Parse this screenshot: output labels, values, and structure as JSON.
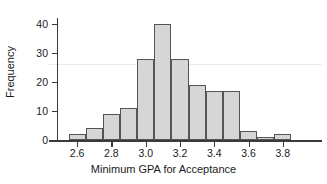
{
  "chart_data": {
    "type": "bar",
    "title": "",
    "subtitle": "",
    "xlabel": "Minimum GPA for Acceptance",
    "ylabel": "Frequency",
    "xlim": [
      2.5,
      3.9
    ],
    "ylim": [
      0,
      42
    ],
    "grid": true,
    "legend": null,
    "bin_width": 0.1,
    "xticks": [
      "2.6",
      "2.8",
      "3.0",
      "3.2",
      "3.4",
      "3.6",
      "3.8"
    ],
    "xtick_values": [
      2.6,
      2.8,
      3.0,
      3.2,
      3.4,
      3.6,
      3.8
    ],
    "yticks": [
      "0",
      "10",
      "20",
      "30",
      "40"
    ],
    "ytick_values": [
      0,
      10,
      20,
      30,
      40
    ],
    "gridlines_y": [
      26
    ],
    "bins": [
      {
        "left": 2.55,
        "right": 2.65,
        "center": 2.6,
        "value": 2
      },
      {
        "left": 2.65,
        "right": 2.75,
        "center": 2.7,
        "value": 4
      },
      {
        "left": 2.75,
        "right": 2.85,
        "center": 2.8,
        "value": 9
      },
      {
        "left": 2.85,
        "right": 2.95,
        "center": 2.9,
        "value": 11
      },
      {
        "left": 2.95,
        "right": 3.05,
        "center": 3.0,
        "value": 28
      },
      {
        "left": 3.05,
        "right": 3.15,
        "center": 3.1,
        "value": 40
      },
      {
        "left": 3.15,
        "right": 3.25,
        "center": 3.2,
        "value": 28
      },
      {
        "left": 3.25,
        "right": 3.35,
        "center": 3.3,
        "value": 19
      },
      {
        "left": 3.35,
        "right": 3.45,
        "center": 3.4,
        "value": 17
      },
      {
        "left": 3.45,
        "right": 3.55,
        "center": 3.5,
        "value": 17
      },
      {
        "left": 3.55,
        "right": 3.65,
        "center": 3.6,
        "value": 3
      },
      {
        "left": 3.65,
        "right": 3.75,
        "center": 3.7,
        "value": 1
      },
      {
        "left": 3.75,
        "right": 3.85,
        "center": 3.8,
        "value": 2
      }
    ],
    "categories": [
      "2.60",
      "2.70",
      "2.80",
      "2.90",
      "3.00",
      "3.10",
      "3.20",
      "3.30",
      "3.40",
      "3.50",
      "3.60",
      "3.70",
      "3.80"
    ],
    "values": [
      2,
      4,
      9,
      11,
      28,
      40,
      28,
      19,
      17,
      17,
      3,
      1,
      2
    ],
    "colors": {
      "bar_fill": "#d6d6d6",
      "bar_border": "#555555",
      "axis": "#3a3a3a",
      "gridline": "#ebebeb",
      "text": "#1a1a1a",
      "background": "#ffffff"
    }
  }
}
